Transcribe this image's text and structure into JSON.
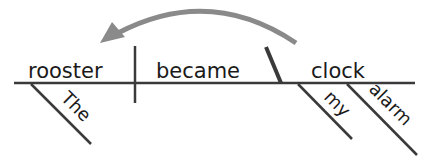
{
  "diagram": {
    "type": "sentence-diagram",
    "sentence": "The rooster became my alarm clock",
    "subject": "rooster",
    "verb": "became",
    "predicate_nominative": "clock",
    "modifiers": {
      "subject": [
        "The"
      ],
      "predicate_nominative": [
        "my",
        "alarm"
      ]
    },
    "arrow": {
      "from": "clock",
      "to": "rooster",
      "color": "#8a8a8a"
    },
    "colors": {
      "line": "#3a3a3a",
      "text": "#1a1a1a",
      "arrow": "#8a8a8a",
      "background": "#ffffff"
    }
  }
}
